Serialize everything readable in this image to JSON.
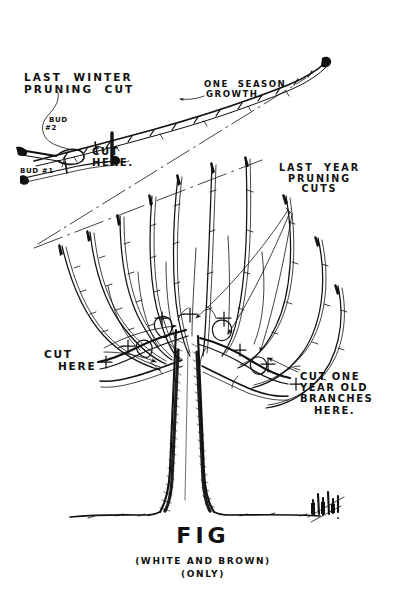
{
  "document": {
    "kind": "hand-drawn pen-and-ink horticultural pruning diagram",
    "subject": "Fig tree pruning",
    "ink_color": "#111111",
    "paper_color": "#ffffff"
  },
  "annotations": {
    "last_winter_pruning_cut": {
      "line1": "LAST  WINTER",
      "line2": "PRUNING  CUT"
    },
    "one_season_growth": {
      "line1": "ONE  SEASON",
      "line2": "GROWTH."
    },
    "bud_two": {
      "line1": "BUD",
      "line2": "#2"
    },
    "bud_one": "BUD #1",
    "cut_here_inset": {
      "line1": "CUT",
      "line2": "HERE."
    },
    "last_year_pruning_cuts": {
      "line1": "LAST  YEAR",
      "line2": "PRUNING",
      "line3": "CUTS"
    },
    "cut_here_left": {
      "line1": "CUT",
      "line2": "HERE"
    },
    "cut_one_year_old_branches": {
      "line1": "CUT ONE",
      "line2": "YEAR OLD",
      "line3": "BRANCHES",
      "line4": "HERE."
    }
  },
  "caption": {
    "title": "FIG",
    "subtitle": "(WHITE AND BROWN)",
    "qualifier": "(ONLY)"
  },
  "signature": {
    "present": true,
    "description": "artist monogram scribble"
  }
}
